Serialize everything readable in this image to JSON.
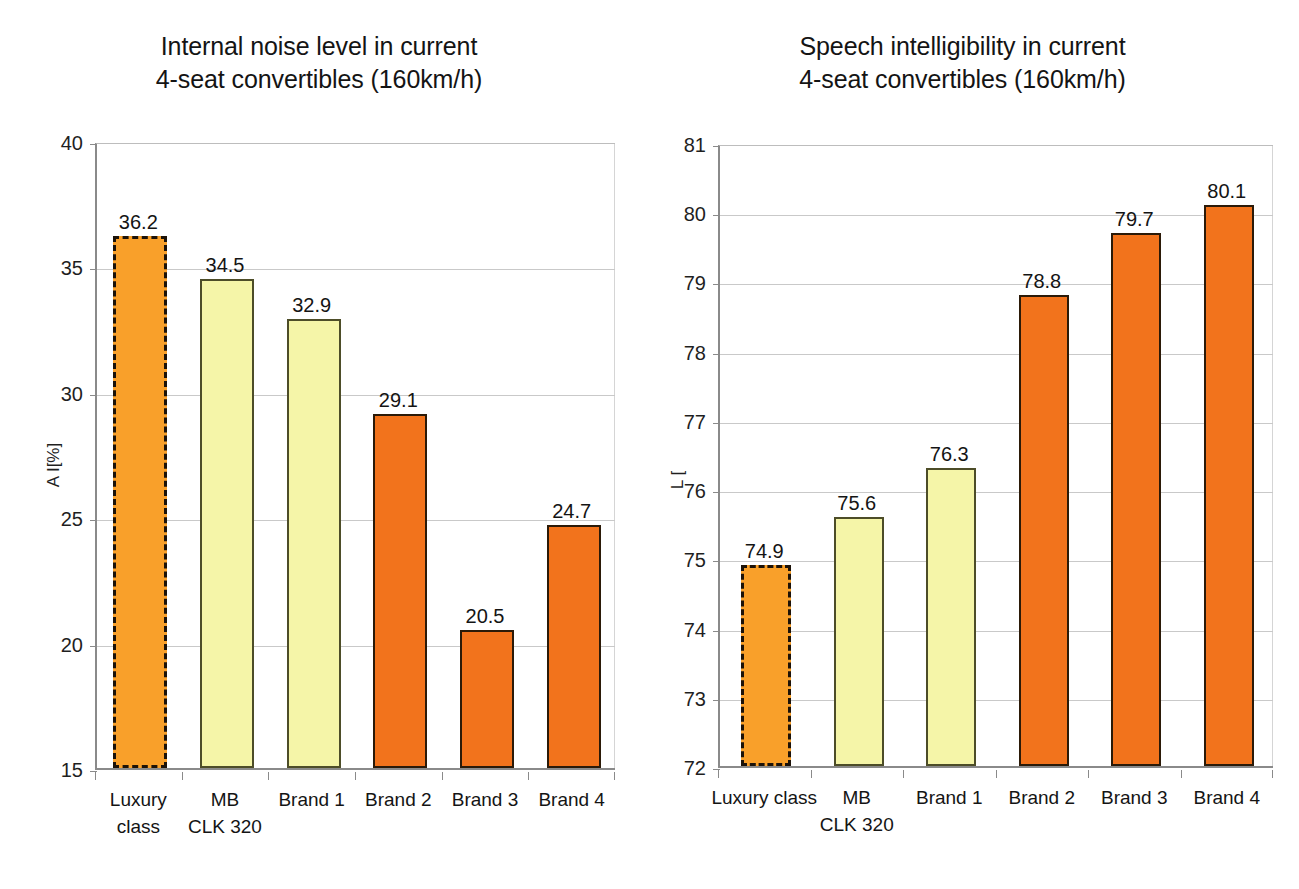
{
  "charts": [
    {
      "id": "left",
      "title": "Internal noise level in current\n4-seat convertibles (160km/h)",
      "ylabel": "A I[%]"
    },
    {
      "id": "right",
      "title": "Speech intelligibility in current\n4-seat convertibles (160km/h)",
      "ylabel": "L ["
    }
  ],
  "colors": {
    "highlight_fill": "#f9a02a",
    "highlight_border": "#1c1208",
    "pale_fill": "#f5f5a8",
    "pale_border": "#4d4d28",
    "orange_fill": "#f2731c",
    "orange_border": "#2b1a08",
    "gridline": "#c9c9c9",
    "axis": "#8a8a8a"
  },
  "chart_data": [
    {
      "type": "bar",
      "title": "Internal noise level in current 4-seat convertibles (160km/h)",
      "xlabel": "",
      "ylabel": "A I[%]",
      "ylim": [
        15,
        40
      ],
      "yticks": [
        15,
        20,
        25,
        30,
        35,
        40
      ],
      "grid": true,
      "legend": "none",
      "categories": [
        "Luxury\nclass",
        "MB\nCLK 320",
        "Brand 1",
        "Brand 2",
        "Brand 3",
        "Brand 4"
      ],
      "values": [
        36.2,
        34.5,
        32.9,
        29.1,
        20.5,
        24.7
      ],
      "value_labels": [
        "36.2",
        "34.5",
        "32.9",
        "29.1",
        "20.5",
        "24.7"
      ],
      "bar_styles": [
        "highlight",
        "pale",
        "pale",
        "orange",
        "orange",
        "orange"
      ]
    },
    {
      "type": "bar",
      "title": "Speech intelligibility in current 4-seat convertibles (160km/h)",
      "xlabel": "",
      "ylabel": "L [",
      "ylim": [
        72,
        81
      ],
      "yticks": [
        72,
        73,
        74,
        75,
        76,
        77,
        78,
        79,
        80,
        81
      ],
      "grid": true,
      "legend": "none",
      "categories": [
        "Luxury class",
        "MB\nCLK 320",
        "Brand 1",
        "Brand 2",
        "Brand 3",
        "Brand 4"
      ],
      "values": [
        74.9,
        75.6,
        76.3,
        78.8,
        79.7,
        80.1
      ],
      "value_labels": [
        "74.9",
        "75.6",
        "76.3",
        "78.8",
        "79.7",
        "80.1"
      ],
      "bar_styles": [
        "highlight",
        "pale",
        "pale",
        "orange",
        "orange",
        "orange"
      ]
    }
  ]
}
